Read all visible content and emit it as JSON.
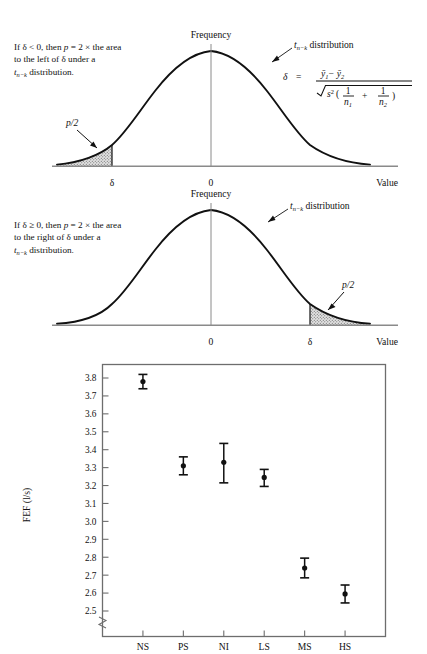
{
  "figure": {
    "panels": [
      {
        "id": "panel-upper",
        "note_lines": [
          "If δ < 0, then p = 2 × the area",
          "to the left of δ under a",
          "t n−k  distribution."
        ],
        "note_line1_a": "If δ < 0, then ",
        "note_line1_p": "p",
        "note_line1_b": " = 2 × the area",
        "note_line2": "to the left of δ under a",
        "note_line3_t": "t",
        "note_line3_sub": "n−k",
        "note_line3_rest": " distribution.",
        "y_axis_label": "Frequency",
        "x_axis_label": "Value",
        "origin_label": "0",
        "delta_label": "δ",
        "shaded_label": "p/2",
        "curve_callout_t": "t",
        "curve_callout_sub": "n−k",
        "curve_callout_rest": " distribution"
      },
      {
        "id": "panel-lower",
        "note_line1_a": "If δ ≥ 0, then ",
        "note_line1_p": "p",
        "note_line1_b": " = 2 × the area",
        "note_line2": "to the right of δ under a",
        "note_line3_t": "t",
        "note_line3_sub": "n−k",
        "note_line3_rest": " distribution.",
        "y_axis_label": "Frequency",
        "x_axis_label": "Value",
        "origin_label": "0",
        "delta_label": "δ",
        "shaded_label": "p/2",
        "curve_callout_t": "t",
        "curve_callout_sub": "n−k",
        "curve_callout_rest": " distribution"
      }
    ],
    "formula": {
      "lhs": "δ",
      "eq": "=",
      "numerator_y1": "ȳ",
      "numerator_sub1": "1",
      "numerator_minus": "−",
      "numerator_y2": "ȳ",
      "numerator_sub2": "2",
      "radical": "√",
      "denom_s": "s",
      "denom_sup": "2",
      "denom_open": "(",
      "denom_frac1_num": "1",
      "denom_frac1_den": "n",
      "denom_frac1_densub": "1",
      "denom_plus": "+",
      "denom_frac2_num": "1",
      "denom_frac2_den": "n",
      "denom_frac2_densub": "2",
      "denom_close": ")"
    }
  },
  "chart_data": {
    "type": "scatter",
    "title": "",
    "xlabel": "",
    "ylabel": "FEF  (l/s)",
    "ylabel_parts": {
      "name": "FEF",
      "units": "(l/s)"
    },
    "categories": [
      "NS",
      "PS",
      "NI",
      "LS",
      "MS",
      "HS"
    ],
    "values": [
      3.78,
      3.31,
      3.33,
      3.245,
      2.74,
      2.595
    ],
    "errors_low": [
      3.74,
      3.26,
      3.215,
      3.195,
      2.685,
      2.545
    ],
    "errors_high": [
      3.82,
      3.36,
      3.435,
      3.29,
      2.795,
      2.645
    ],
    "ylim": [
      2.45,
      3.85
    ],
    "yticks": [
      2.5,
      2.6,
      2.7,
      2.8,
      2.9,
      3.0,
      3.1,
      3.2,
      3.3,
      3.4,
      3.5,
      3.6,
      3.7,
      3.8
    ],
    "ytick_labels": [
      "2.5",
      "2.6",
      "2.7",
      "2.8",
      "2.9",
      "3.0",
      "3.1",
      "3.2",
      "3.3",
      "3.4",
      "3.5",
      "3.6",
      "3.7",
      "3.8"
    ],
    "axis_break": true,
    "grid": false,
    "legend": "none",
    "marker": "filled-circle-with-error-bars"
  },
  "colors": {
    "ink": "#111111",
    "axis": "#555555",
    "shade": "#cfcfcf",
    "frame": "#6d6d6d"
  }
}
